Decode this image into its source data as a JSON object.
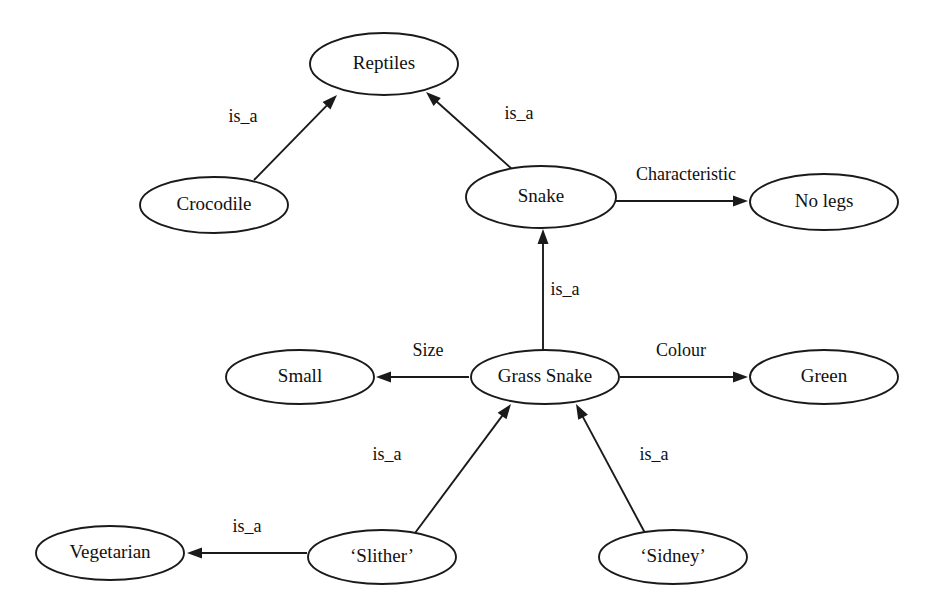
{
  "diagram": {
    "type": "semantic-network",
    "title": "",
    "background_color": "#ffffff",
    "stroke_color": "#1a1a1a",
    "text_color": "#111111",
    "nodes": [
      {
        "id": "reptiles",
        "label": "Reptiles",
        "cx": 384,
        "cy": 64,
        "rx": 74,
        "ry": 31
      },
      {
        "id": "crocodile",
        "label": "Crocodile",
        "cx": 214,
        "cy": 205,
        "rx": 74,
        "ry": 28
      },
      {
        "id": "snake",
        "label": "Snake",
        "cx": 541,
        "cy": 197,
        "rx": 75,
        "ry": 31
      },
      {
        "id": "no_legs",
        "label": "No legs",
        "cx": 824,
        "cy": 202,
        "rx": 74,
        "ry": 28
      },
      {
        "id": "small",
        "label": "Small",
        "cx": 300,
        "cy": 377,
        "rx": 74,
        "ry": 27
      },
      {
        "id": "grass_snake",
        "label": "Grass Snake",
        "cx": 545,
        "cy": 377,
        "rx": 74,
        "ry": 27
      },
      {
        "id": "green",
        "label": "Green",
        "cx": 824,
        "cy": 377,
        "rx": 74,
        "ry": 27
      },
      {
        "id": "vegetarian",
        "label": "Vegetarian",
        "cx": 110,
        "cy": 553,
        "rx": 74,
        "ry": 27
      },
      {
        "id": "slither",
        "label": "‘Slither’",
        "cx": 382,
        "cy": 557,
        "rx": 74,
        "ry": 27
      },
      {
        "id": "sidney",
        "label": "‘Sidney’",
        "cx": 673,
        "cy": 557,
        "rx": 74,
        "ry": 27
      }
    ],
    "edges": [
      {
        "id": "crocodile-is_a-reptiles",
        "from": "crocodile",
        "to": "reptiles",
        "label": "is_a",
        "x1": 254,
        "y1": 180,
        "x2": 337,
        "y2": 95,
        "label_x": 243,
        "label_y": 118
      },
      {
        "id": "snake-is_a-reptiles",
        "from": "snake",
        "to": "reptiles",
        "label": "is_a",
        "x1": 513,
        "y1": 170,
        "x2": 426,
        "y2": 92,
        "label_x": 519,
        "label_y": 115
      },
      {
        "id": "snake-characteristic-nolegs",
        "from": "snake",
        "to": "no_legs",
        "label": "Characteristic",
        "x1": 616,
        "y1": 201,
        "x2": 748,
        "y2": 201,
        "label_x": 686,
        "label_y": 176
      },
      {
        "id": "grasssnake-is_a-snake",
        "from": "grass_snake",
        "to": "snake",
        "label": "is_a",
        "x1": 543,
        "y1": 350,
        "x2": 543,
        "y2": 229,
        "label_x": 565,
        "label_y": 291
      },
      {
        "id": "grasssnake-size-small",
        "from": "grass_snake",
        "to": "small",
        "label": "Size",
        "x1": 469,
        "y1": 377,
        "x2": 376,
        "y2": 377,
        "label_x": 428,
        "label_y": 352
      },
      {
        "id": "grasssnake-colour-green",
        "from": "grass_snake",
        "to": "green",
        "label": "Colour",
        "x1": 620,
        "y1": 377,
        "x2": 748,
        "y2": 377,
        "label_x": 681,
        "label_y": 352
      },
      {
        "id": "slither-is_a-grasssnake",
        "from": "slither",
        "to": "grass_snake",
        "label": "is_a",
        "x1": 415,
        "y1": 533,
        "x2": 511,
        "y2": 404,
        "label_x": 387,
        "label_y": 456
      },
      {
        "id": "sidney-is_a-grasssnake",
        "from": "sidney",
        "to": "grass_snake",
        "label": "is_a",
        "x1": 645,
        "y1": 533,
        "x2": 576,
        "y2": 404,
        "label_x": 654,
        "label_y": 456
      },
      {
        "id": "slither-is_a-vegetarian",
        "from": "slither",
        "to": "vegetarian",
        "label": "is_a",
        "x1": 307,
        "y1": 553,
        "x2": 187,
        "y2": 553,
        "label_x": 247,
        "label_y": 528
      }
    ]
  }
}
